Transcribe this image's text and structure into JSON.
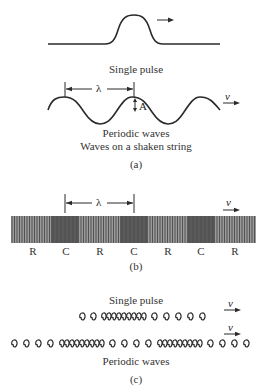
{
  "panel_a": {
    "pulse_caption": "Single pulse",
    "wave_caption_1": "Periodic waves",
    "wave_caption_2": "Waves on a shaken string",
    "panel_label": "(a)",
    "wavelength_symbol": "λ",
    "amplitude_symbol": "A",
    "velocity_symbol": "v"
  },
  "panel_b": {
    "wavelength_symbol": "λ",
    "velocity_symbol": "v",
    "region_labels": [
      "R",
      "C",
      "R",
      "C",
      "R",
      "C",
      "R"
    ],
    "panel_label": "(b)"
  },
  "panel_c": {
    "pulse_caption": "Single pulse",
    "wave_caption": "Periodic waves",
    "velocity_symbol_pulse": "v",
    "velocity_symbol_wave": "v",
    "panel_label": "(c)"
  }
}
